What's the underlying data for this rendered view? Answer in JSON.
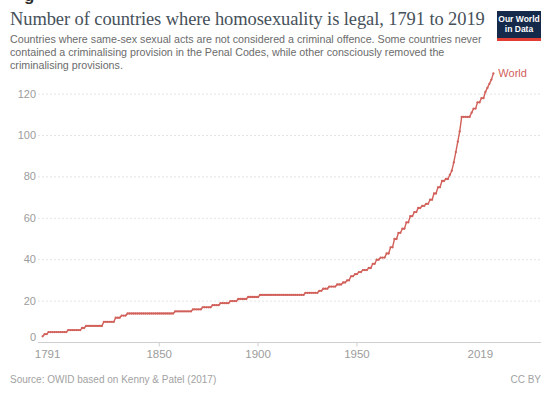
{
  "artifact": {
    "glyph": "g"
  },
  "header": {
    "title": "Number of countries where homosexuality is legal, 1791 to 2019",
    "subtitle": "Countries where same-sex sexual acts are not considered a criminal offence. Some countries never contained a criminalising provision in the Penal Codes, while other consciously removed the criminalising provisions."
  },
  "logo": {
    "line1": "Our World",
    "line2": "in Data",
    "bg_color": "#15294a",
    "accent_color": "#e23d33"
  },
  "chart_data": {
    "type": "line",
    "title": "Number of countries where homosexuality is legal, 1791 to 2019",
    "xlabel": "",
    "ylabel": "",
    "xlim": [
      1791,
      2019
    ],
    "ylim": [
      0,
      130
    ],
    "grid": "horizontal-dashed",
    "legend_position": "line-end-label",
    "x_ticks": [
      {
        "year": 1791,
        "label": "1791"
      },
      {
        "year": 1850,
        "label": "1850"
      },
      {
        "year": 1900,
        "label": "1900"
      },
      {
        "year": 1950,
        "label": "1950"
      },
      {
        "year": 2019,
        "label": "2019"
      }
    ],
    "y_ticks": [
      0,
      20,
      40,
      60,
      80,
      100,
      120
    ],
    "colors": {
      "line": "#d1605a",
      "axis_label": "#9c9c9c",
      "axis_line": "#cfcfcf",
      "gridline": "#e4e4e4"
    },
    "series": [
      {
        "name": "World",
        "color": "#d1605a",
        "step": true,
        "points": [
          [
            1791,
            3
          ],
          [
            1792,
            4
          ],
          [
            1794,
            5
          ],
          [
            1804,
            6
          ],
          [
            1811,
            7
          ],
          [
            1813,
            8
          ],
          [
            1822,
            10
          ],
          [
            1828,
            12
          ],
          [
            1831,
            13
          ],
          [
            1834,
            14
          ],
          [
            1858,
            15
          ],
          [
            1867,
            16
          ],
          [
            1872,
            17
          ],
          [
            1877,
            18
          ],
          [
            1881,
            19
          ],
          [
            1886,
            20
          ],
          [
            1890,
            21
          ],
          [
            1895,
            22
          ],
          [
            1901,
            23
          ],
          [
            1924,
            24
          ],
          [
            1931,
            25
          ],
          [
            1933,
            26
          ],
          [
            1936,
            27
          ],
          [
            1940,
            28
          ],
          [
            1943,
            29
          ],
          [
            1945,
            30
          ],
          [
            1947,
            32
          ],
          [
            1949,
            33
          ],
          [
            1951,
            34
          ],
          [
            1953,
            35
          ],
          [
            1956,
            36
          ],
          [
            1958,
            38
          ],
          [
            1960,
            40
          ],
          [
            1962,
            41
          ],
          [
            1965,
            43
          ],
          [
            1967,
            46
          ],
          [
            1969,
            50
          ],
          [
            1971,
            53
          ],
          [
            1973,
            55
          ],
          [
            1975,
            58
          ],
          [
            1977,
            61
          ],
          [
            1979,
            63
          ],
          [
            1981,
            65
          ],
          [
            1983,
            66
          ],
          [
            1985,
            67
          ],
          [
            1987,
            69
          ],
          [
            1989,
            72
          ],
          [
            1991,
            75
          ],
          [
            1993,
            78
          ],
          [
            1995,
            79
          ],
          [
            1997,
            81
          ],
          [
            1998,
            83
          ],
          [
            1999,
            87
          ],
          [
            2000,
            92
          ],
          [
            2001,
            97
          ],
          [
            2002,
            102
          ],
          [
            2003,
            109
          ],
          [
            2008,
            111
          ],
          [
            2009,
            113
          ],
          [
            2011,
            116
          ],
          [
            2013,
            118
          ],
          [
            2015,
            121
          ],
          [
            2016,
            123
          ],
          [
            2017,
            125
          ],
          [
            2018,
            127
          ],
          [
            2019,
            130
          ]
        ]
      }
    ]
  },
  "footer": {
    "source": "Source: OWID based on Kenny & Patel (2017)",
    "license": "CC BY"
  }
}
